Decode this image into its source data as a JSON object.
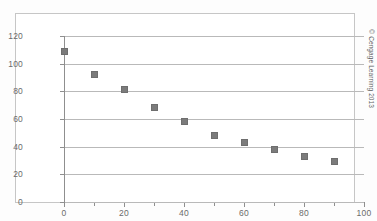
{
  "chart_data": {
    "type": "scatter",
    "title": "",
    "xlabel": "",
    "ylabel": "",
    "xlim": [
      0,
      100
    ],
    "ylim": [
      0,
      120
    ],
    "grid": true,
    "legend": null,
    "marker": "square",
    "marker_color": "#7b7b7b",
    "x_ticks": [
      0,
      20,
      40,
      60,
      80,
      100
    ],
    "x_tick_labels": [
      "0",
      "20",
      "40",
      "60",
      "80",
      "100"
    ],
    "x_minor_ticks": [
      10,
      30,
      50,
      70,
      90
    ],
    "y_ticks": [
      0,
      20,
      40,
      60,
      80,
      100,
      120
    ],
    "y_tick_labels": [
      "0",
      "20",
      "40",
      "60",
      "80",
      "100",
      "120"
    ],
    "x": [
      0,
      10,
      20,
      30,
      40,
      50,
      60,
      70,
      80,
      90
    ],
    "values": [
      109,
      92,
      81,
      68,
      58,
      48,
      43,
      38,
      33,
      29
    ],
    "points": [
      {
        "x": 0,
        "y": 109
      },
      {
        "x": 10,
        "y": 92
      },
      {
        "x": 20,
        "y": 81
      },
      {
        "x": 30,
        "y": 68
      },
      {
        "x": 40,
        "y": 58
      },
      {
        "x": 50,
        "y": 48
      },
      {
        "x": 60,
        "y": 43
      },
      {
        "x": 70,
        "y": 38
      },
      {
        "x": 80,
        "y": 33
      },
      {
        "x": 90,
        "y": 29
      }
    ]
  },
  "page": {
    "copyright": "© Cengage Learning 2013",
    "caption": "Figure 11-11"
  },
  "colors": {
    "marker": "#7b7b7b",
    "gridline": "#b9b9b9",
    "axis": "#8f8f8f",
    "frame": "#c6c6c6",
    "tick_label": "#6b6b6b",
    "plot_background": "#ffffff"
  }
}
